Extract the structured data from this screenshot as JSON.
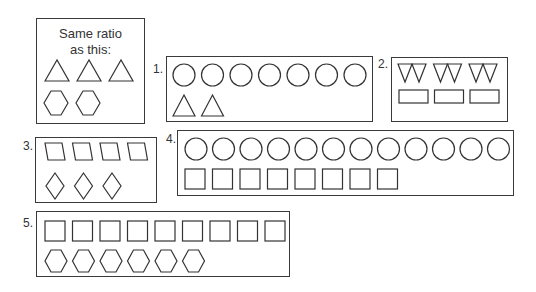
{
  "reference": {
    "title_line1": "Same ratio",
    "title_line2": "as this:",
    "shapes": [
      {
        "type": "triangle",
        "count": 3
      },
      {
        "type": "hexagon",
        "count": 2
      }
    ]
  },
  "problems": [
    {
      "label": "1.",
      "rows": [
        {
          "type": "circle",
          "count": 7
        },
        {
          "type": "triangle",
          "count": 2
        }
      ]
    },
    {
      "label": "2.",
      "rows": [
        {
          "type": "inverted-triangle",
          "count": 6
        },
        {
          "type": "rectangle",
          "count": 3
        }
      ]
    },
    {
      "label": "3.",
      "rows": [
        {
          "type": "parallelogram",
          "count": 4
        },
        {
          "type": "diamond",
          "count": 3
        }
      ]
    },
    {
      "label": "4.",
      "rows": [
        {
          "type": "circle",
          "count": 12
        },
        {
          "type": "square",
          "count": 8
        }
      ]
    },
    {
      "label": "5.",
      "rows": [
        {
          "type": "square",
          "count": 9
        },
        {
          "type": "hexagon",
          "count": 6
        }
      ]
    }
  ],
  "colors": {
    "stroke": "#333333",
    "background": "#ffffff"
  }
}
